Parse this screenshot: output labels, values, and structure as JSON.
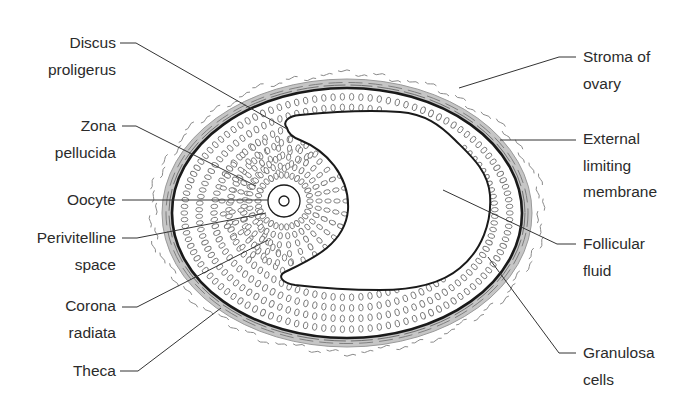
{
  "figure": {
    "colors": {
      "outline": "#1a1a1a",
      "theca_fill": "#c4c4c4",
      "cell_stroke": "#777777",
      "wavy_stroke": "#8a8a8a",
      "leader": "#333333",
      "text": "#2b2b2b",
      "background": "#ffffff"
    },
    "follicle": {
      "cx": 347,
      "cy": 213,
      "rx": 175,
      "ry": 125
    },
    "oocyte": {
      "cx": 284,
      "cy": 201,
      "r_outer": 16,
      "r_inner": 5
    }
  },
  "labels_left": [
    {
      "id": "discus-proligerus",
      "lines": [
        "Discus",
        "proligerus"
      ],
      "top": 30,
      "right": 116
    },
    {
      "id": "zona-pellucida",
      "lines": [
        "Zona",
        "pellucida"
      ],
      "top": 113,
      "right": 116
    },
    {
      "id": "oocyte",
      "lines": [
        "Oocyte"
      ],
      "top": 187,
      "right": 116
    },
    {
      "id": "perivitelline-space",
      "lines": [
        "Perivitelline",
        "space"
      ],
      "top": 225,
      "right": 116
    },
    {
      "id": "corona-radiata",
      "lines": [
        "Corona",
        "radiata"
      ],
      "top": 293,
      "right": 116
    },
    {
      "id": "theca",
      "lines": [
        "Theca"
      ],
      "top": 358,
      "right": 116
    }
  ],
  "labels_right": [
    {
      "id": "stroma-of-ovary",
      "lines": [
        "Stroma of",
        "ovary"
      ],
      "top": 44,
      "left": 583
    },
    {
      "id": "external-limiting-membrane",
      "lines": [
        "External",
        "limiting",
        "membrane"
      ],
      "top": 126,
      "left": 583
    },
    {
      "id": "follicular-fluid",
      "lines": [
        "Follicular",
        "fluid"
      ],
      "top": 231,
      "left": 583
    },
    {
      "id": "granulosa-cells",
      "lines": [
        "Granulosa",
        "cells"
      ],
      "top": 340,
      "left": 583
    }
  ],
  "leaders": [
    {
      "for": "discus-proligerus",
      "points": "120,43 136,43 287,129"
    },
    {
      "for": "zona-pellucida",
      "points": "122,126 136,126 256,186"
    },
    {
      "for": "oocyte",
      "points": "122,200 268,200"
    },
    {
      "for": "perivitelline-space",
      "points": "122,238 137,238 266,213"
    },
    {
      "for": "corona-radiata",
      "points": "122,307 137,307 268,240"
    },
    {
      "for": "theca",
      "points": "120,371 138,371 221,308"
    },
    {
      "for": "stroma-of-ovary",
      "points": "576,57 559,57 459,88"
    },
    {
      "for": "external-limiting-membrane",
      "points": "576,140 500,140"
    },
    {
      "for": "follicular-fluid",
      "points": "576,244 557,244 443,190"
    },
    {
      "for": "granulosa-cells",
      "points": "576,353 559,353 488,257"
    }
  ]
}
